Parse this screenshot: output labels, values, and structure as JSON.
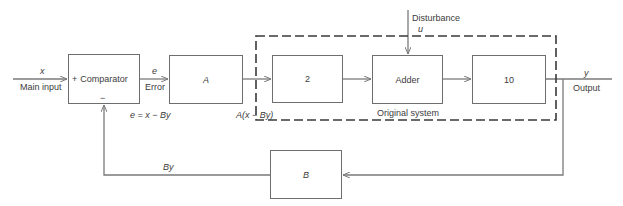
{
  "diagram": {
    "type": "block-diagram",
    "colors": {
      "line": "#7a7a7a",
      "text": "#3c3c3c",
      "background": "#ffffff"
    },
    "input": {
      "symbol": "x",
      "label": "Main input"
    },
    "comparator": {
      "label": "Comparator",
      "plus_sign": "+",
      "minus_sign": "−"
    },
    "error": {
      "symbol": "e",
      "label": "Error",
      "equation": "e = x − By"
    },
    "blocks": {
      "A": "A",
      "two": "2",
      "adder": "Adder",
      "ten": "10",
      "B": "B"
    },
    "a_output_label": "A(x − By)",
    "disturbance": {
      "label": "Disturbance",
      "symbol": "u"
    },
    "original_system_label": "Original system",
    "output": {
      "symbol": "y",
      "label": "Output"
    },
    "feedback_label": "By"
  }
}
